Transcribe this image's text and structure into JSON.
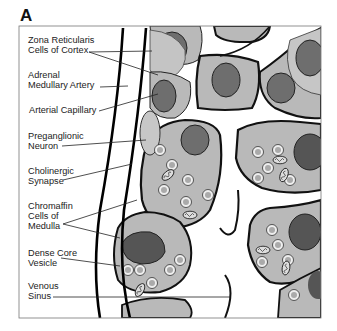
{
  "figure": {
    "panel_letter": "A",
    "labels": [
      {
        "id": "zona",
        "text": "Zona Reticularis\nCells of Cortex",
        "x": 28,
        "y": 35
      },
      {
        "id": "artery",
        "text": "Adrenal\nMedullary Artery",
        "x": 28,
        "y": 70
      },
      {
        "id": "capillary",
        "text": "Arterial Capillary",
        "x": 29,
        "y": 105
      },
      {
        "id": "neuron",
        "text": "Preganglionic\nNeuron",
        "x": 28,
        "y": 131
      },
      {
        "id": "synapse",
        "text": "Cholinergic\nSynapse",
        "x": 28,
        "y": 166
      },
      {
        "id": "chromaffin",
        "text": "Chromaffin\nCells of\nMedulla",
        "x": 28,
        "y": 201
      },
      {
        "id": "vesicle",
        "text": "Dense Core\nVesicle",
        "x": 28,
        "y": 248
      },
      {
        "id": "sinus",
        "text": "Venous\nSinus",
        "x": 28,
        "y": 281
      }
    ],
    "colors": {
      "cell_fill": "#b9b9b9",
      "nucleus_fill": "#6e6e6e",
      "outline": "#111111",
      "background": "#ffffff",
      "vesicle_fill": "#e4e4e4"
    }
  }
}
